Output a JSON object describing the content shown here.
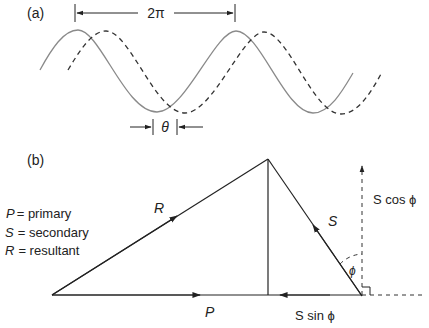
{
  "panel_a": {
    "label": "(a)",
    "period_label": "2π",
    "phase_label": "θ",
    "solid_color": "#8a8a8a",
    "dashed_color": "#333333"
  },
  "panel_b": {
    "label": "(b)",
    "legend": [
      {
        "symbol": "P",
        "text": "= primary"
      },
      {
        "symbol": "S",
        "text": "= secondary"
      },
      {
        "symbol": "R",
        "text": "= resultant"
      }
    ],
    "vector_labels": {
      "R": "R",
      "S": "S",
      "P": "P",
      "s_cos": "S cos ϕ",
      "s_sin": "S sin ϕ",
      "phi": "ϕ"
    }
  }
}
